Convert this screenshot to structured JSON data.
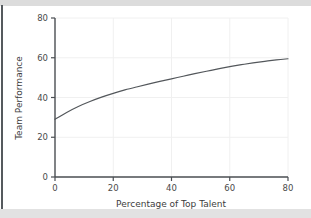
{
  "chart_data": {
    "type": "line",
    "title": "",
    "subtitle": "",
    "xlabel": "Percentage of Top Talent",
    "ylabel": "Team Performance",
    "xlim": [
      0,
      80
    ],
    "ylim": [
      0,
      80
    ],
    "xticks": [
      0,
      20,
      40,
      60,
      80
    ],
    "yticks": [
      0,
      20,
      40,
      60,
      80
    ],
    "xtick_labels": [
      "0",
      "20",
      "40",
      "60",
      "80"
    ],
    "ytick_labels": [
      "0",
      "20",
      "40",
      "60",
      "80"
    ],
    "grid": true,
    "grid_color": "#f0f0f0",
    "legend": null,
    "legend_position": "none",
    "annotations": [],
    "series": [
      {
        "name": "Team Performance",
        "color": "#53575b",
        "line_width": 1.2,
        "x": [
          0,
          4,
          8,
          12,
          16,
          20,
          24,
          28,
          32,
          36,
          40,
          44,
          48,
          52,
          56,
          60,
          64,
          68,
          72,
          76,
          80
        ],
        "values": [
          29.0,
          32.5,
          35.5,
          38.0,
          40.2,
          42.1,
          43.8,
          45.3,
          46.7,
          48.1,
          49.4,
          50.7,
          52.0,
          53.2,
          54.4,
          55.5,
          56.5,
          57.4,
          58.2,
          58.9,
          59.5
        ]
      }
    ]
  },
  "axis": {
    "x_title": "Percentage of Top Talent",
    "y_title": "Team Performance",
    "spine_color": "#4a4e52"
  },
  "figure": {
    "background": "#ffffff",
    "band_color": "#dcdcdc",
    "edge_color": "#555a5e"
  }
}
